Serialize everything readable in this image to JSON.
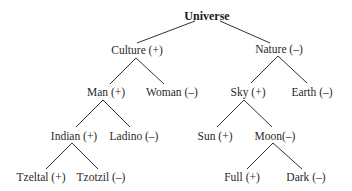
{
  "diagram": {
    "type": "tree",
    "nodes": [
      {
        "id": "universe",
        "label": "Universe",
        "x": 207,
        "y": 10,
        "root": true
      },
      {
        "id": "culture",
        "label": "Culture (+)",
        "x": 137,
        "y": 44
      },
      {
        "id": "nature",
        "label": "Nature (–)",
        "x": 279,
        "y": 43
      },
      {
        "id": "man",
        "label": "Man (+)",
        "x": 106,
        "y": 86
      },
      {
        "id": "woman",
        "label": "Woman (–)",
        "x": 172,
        "y": 86
      },
      {
        "id": "sky",
        "label": "Sky (+)",
        "x": 248,
        "y": 86
      },
      {
        "id": "earth",
        "label": "Earth (–)",
        "x": 312,
        "y": 86
      },
      {
        "id": "indian",
        "label": "Indian (+)",
        "x": 74,
        "y": 130
      },
      {
        "id": "ladino",
        "label": "Ladino (–)",
        "x": 134,
        "y": 130
      },
      {
        "id": "sun",
        "label": "Sun (+)",
        "x": 215,
        "y": 130
      },
      {
        "id": "moon",
        "label": "Moon(–)",
        "x": 275,
        "y": 130
      },
      {
        "id": "tzeltal",
        "label": "Tzeltal (+)",
        "x": 41,
        "y": 171
      },
      {
        "id": "tzotzil",
        "label": "Tzotzil (–)",
        "x": 101,
        "y": 171
      },
      {
        "id": "full",
        "label": "Full (+)",
        "x": 242,
        "y": 171
      },
      {
        "id": "dark",
        "label": "Dark (–)",
        "x": 306,
        "y": 171
      }
    ],
    "edges": [
      {
        "from": "universe",
        "to": "culture",
        "x1": 195,
        "y1": 21,
        "x2": 137,
        "y2": 43
      },
      {
        "from": "universe",
        "to": "nature",
        "x1": 220,
        "y1": 21,
        "x2": 270,
        "y2": 43
      },
      {
        "from": "culture",
        "to": "man",
        "x1": 136,
        "y1": 58,
        "x2": 110,
        "y2": 84
      },
      {
        "from": "culture",
        "to": "woman",
        "x1": 136,
        "y1": 58,
        "x2": 164,
        "y2": 84
      },
      {
        "from": "nature",
        "to": "sky",
        "x1": 278,
        "y1": 56,
        "x2": 251,
        "y2": 83
      },
      {
        "from": "nature",
        "to": "earth",
        "x1": 278,
        "y1": 56,
        "x2": 307,
        "y2": 83
      },
      {
        "from": "man",
        "to": "indian",
        "x1": 103,
        "y1": 100,
        "x2": 76,
        "y2": 127
      },
      {
        "from": "man",
        "to": "ladino",
        "x1": 103,
        "y1": 100,
        "x2": 130,
        "y2": 127
      },
      {
        "from": "sky",
        "to": "sun",
        "x1": 244,
        "y1": 100,
        "x2": 217,
        "y2": 127
      },
      {
        "from": "sky",
        "to": "moon",
        "x1": 244,
        "y1": 100,
        "x2": 272,
        "y2": 127
      },
      {
        "from": "indian",
        "to": "tzeltal",
        "x1": 72,
        "y1": 143,
        "x2": 46,
        "y2": 169
      },
      {
        "from": "indian",
        "to": "tzotzil",
        "x1": 72,
        "y1": 143,
        "x2": 98,
        "y2": 169
      },
      {
        "from": "moon",
        "to": "full",
        "x1": 273,
        "y1": 143,
        "x2": 247,
        "y2": 169
      },
      {
        "from": "moon",
        "to": "dark",
        "x1": 273,
        "y1": 143,
        "x2": 302,
        "y2": 169
      }
    ]
  }
}
